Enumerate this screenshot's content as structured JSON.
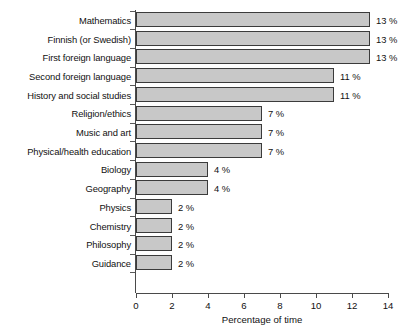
{
  "chart_data": {
    "type": "bar",
    "orientation": "horizontal",
    "title": "",
    "xlabel": "Percentage of time",
    "ylabel": "",
    "xlim": [
      0,
      14
    ],
    "xticks": [
      0,
      2,
      4,
      6,
      8,
      10,
      12,
      14
    ],
    "grid": false,
    "legend": null,
    "categories": [
      "Mathematics",
      "Finnish (or Swedish)",
      "First foreign language",
      "Second foreign language",
      "History and social studies",
      "Religion/ethics",
      "Music and art",
      "Physical/health education",
      "Biology",
      "Geography",
      "Physics",
      "Chemistry",
      "Philosophy",
      "Guidance"
    ],
    "values": [
      13,
      13,
      13,
      11,
      11,
      7,
      7,
      7,
      4,
      4,
      2,
      2,
      2,
      2
    ],
    "value_labels": [
      "13 %",
      "13 %",
      "13 %",
      "11 %",
      "11 %",
      "7 %",
      "7 %",
      "7 %",
      "4 %",
      "4 %",
      "2 %",
      "2 %",
      "2 %",
      "2 %"
    ],
    "colors": {
      "bar_fill": "#c8c8c8",
      "bar_border": "#3b3b3b",
      "axis": "#4a4a4a",
      "text": "#111111",
      "background": "#ffffff"
    }
  }
}
